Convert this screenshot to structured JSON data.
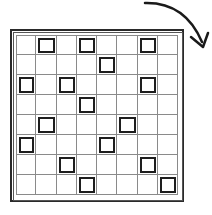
{
  "diagram": {
    "type": "grid-pattern",
    "rows": 8,
    "cols": 8,
    "marked_cells": [
      [
        0,
        1
      ],
      [
        0,
        3
      ],
      [
        0,
        6
      ],
      [
        1,
        4
      ],
      [
        2,
        0
      ],
      [
        2,
        2
      ],
      [
        2,
        6
      ],
      [
        3,
        3
      ],
      [
        4,
        1
      ],
      [
        4,
        5
      ],
      [
        5,
        0
      ],
      [
        5,
        4
      ],
      [
        6,
        2
      ],
      [
        6,
        6
      ],
      [
        7,
        3
      ],
      [
        7,
        7
      ]
    ],
    "arrow": {
      "direction": "clockwise-rotation",
      "position": "top-right"
    },
    "caption": "",
    "colors": {
      "line": "#8a8a8a",
      "frame": "#2a2a2a",
      "marked": "#1e1e1e",
      "background": "#ffffff"
    }
  }
}
